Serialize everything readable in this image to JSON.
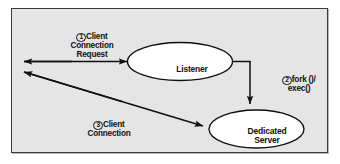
{
  "figure": {
    "background_color": "#ffffff",
    "panel_color": "#e5e5e5",
    "border_color": "#3b3b3b",
    "ink_color": "#101010",
    "node_fill": "#ffffff"
  },
  "nodes": {
    "listener": {
      "label": "Listener",
      "shape": "ellipse"
    },
    "dedicated_server": {
      "label": "Dedicated\nServer",
      "shape": "ellipse"
    }
  },
  "edges": {
    "client_request": {
      "step": "1",
      "label": "Client\nConnection\nRequest",
      "from": "client",
      "to": "listener"
    },
    "fork_exec": {
      "step": "2",
      "label": "fork ()/\nexec()",
      "from": "listener",
      "to": "dedicated_server"
    },
    "client_connection": {
      "step": "3",
      "label": "Client\nConnection",
      "from": "dedicated_server",
      "to": "client"
    }
  }
}
